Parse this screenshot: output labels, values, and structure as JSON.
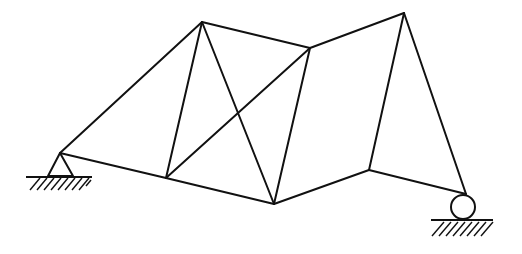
{
  "diagram": {
    "type": "truss",
    "stroke_color": "#111111",
    "background": "#ffffff",
    "nodes": [
      {
        "id": "A",
        "x": 60,
        "y": 153,
        "role": "pin-support"
      },
      {
        "id": "B",
        "x": 202,
        "y": 22
      },
      {
        "id": "C",
        "x": 166,
        "y": 178
      },
      {
        "id": "D",
        "x": 274,
        "y": 204
      },
      {
        "id": "E",
        "x": 310,
        "y": 48
      },
      {
        "id": "F",
        "x": 404,
        "y": 13
      },
      {
        "id": "G",
        "x": 369,
        "y": 170
      },
      {
        "id": "H",
        "x": 466,
        "y": 194,
        "role": "roller-support"
      }
    ],
    "members": [
      {
        "from": "A",
        "to": "B"
      },
      {
        "from": "A",
        "to": "C"
      },
      {
        "from": "B",
        "to": "C"
      },
      {
        "from": "B",
        "to": "D"
      },
      {
        "from": "B",
        "to": "E"
      },
      {
        "from": "C",
        "to": "E"
      },
      {
        "from": "C",
        "to": "D"
      },
      {
        "from": "D",
        "to": "E"
      },
      {
        "from": "E",
        "to": "F"
      },
      {
        "from": "D",
        "to": "G"
      },
      {
        "from": "F",
        "to": "G"
      },
      {
        "from": "F",
        "to": "H"
      },
      {
        "from": "G",
        "to": "H"
      }
    ],
    "supports": {
      "pin": {
        "node": "A",
        "label": "pin-support"
      },
      "roller": {
        "node": "H",
        "label": "roller-support"
      }
    }
  }
}
